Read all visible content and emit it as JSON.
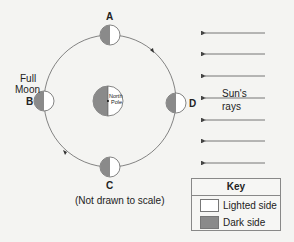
{
  "diagram": {
    "labels": {
      "a": "A",
      "b": "B",
      "c": "C",
      "d": "D",
      "full_moon": [
        "Full",
        "Moon"
      ],
      "earth": [
        "North",
        "Pole"
      ],
      "sun_rays": [
        "Sun's",
        "rays"
      ],
      "note": "(Not drawn to scale)"
    },
    "key": {
      "title": "Key",
      "items": [
        {
          "label": "Lighted side",
          "color": "#ffffff"
        },
        {
          "label": "Dark side",
          "color": "#8a8a8a"
        }
      ]
    },
    "colors": {
      "dark": "#8a8a8a",
      "light": "#ffffff",
      "line": "#555555"
    },
    "ray_count": 7
  }
}
